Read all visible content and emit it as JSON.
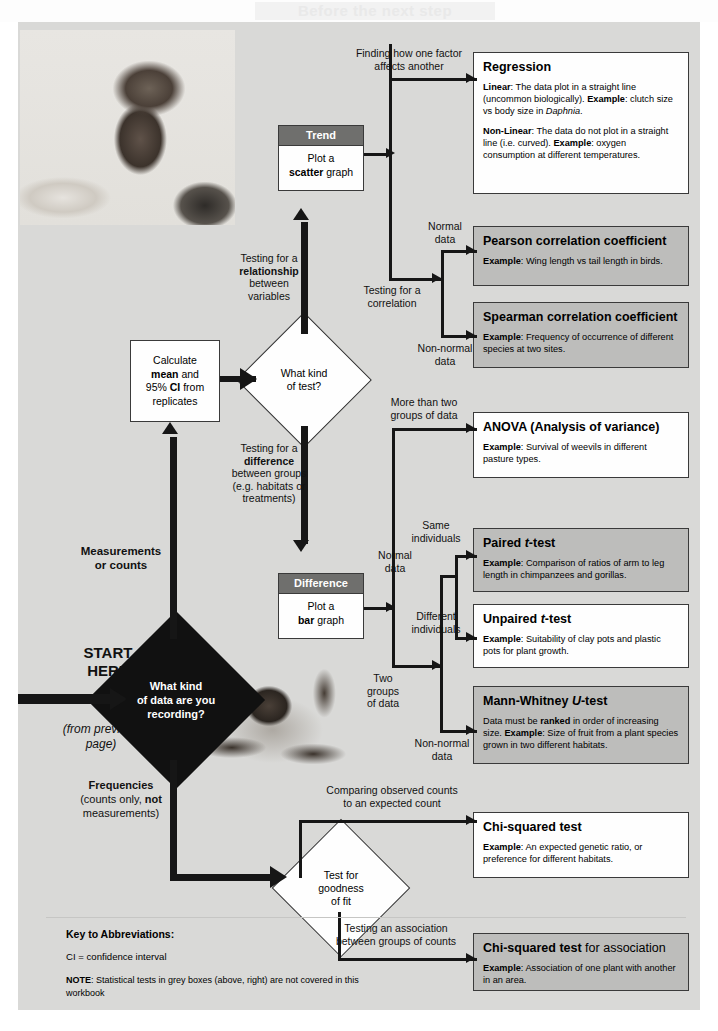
{
  "page": {
    "header_title": "Before the next step",
    "background": "#d9d9d7"
  },
  "photos": [
    {
      "name": "student-with-laptop-photo",
      "alt": "Student working at a laptop with books"
    },
    {
      "name": "crab-photo",
      "alt": "Crab"
    }
  ],
  "start": {
    "start_label": "START\nHERE",
    "start_line1": "START",
    "start_line2": "HERE",
    "from_previous": "(from previous page)",
    "from_previous_l1": "(from previous",
    "from_previous_l2": "page)"
  },
  "decisions": [
    {
      "id": "data-type",
      "style": "black",
      "line1": "What kind",
      "line2": "of data are you",
      "line3": "recording?"
    },
    {
      "id": "test-type",
      "style": "white",
      "line1": "What kind",
      "line2": "of test?"
    },
    {
      "id": "goodness-of-fit",
      "style": "white",
      "line1": "Test for",
      "line2": "goodness",
      "line3": "of fit"
    }
  ],
  "branch_labels": {
    "measurements_l1": "Measurements",
    "measurements_l2": "or counts",
    "frequencies_title": "Frequencies",
    "frequencies_l2a": "(counts only, ",
    "frequencies_l2b": "not",
    "frequencies_l3": "measurements)",
    "relationship_l1": "Testing for a",
    "relationship_l2": "relationship",
    "relationship_l3": "between",
    "relationship_l4": "variables",
    "difference_l1": "Testing for a",
    "difference_l2": "difference",
    "difference_l3": "between groups",
    "difference_l4": "(e.g. habitats or",
    "difference_l5": "treatments)",
    "one_factor_l1": "Finding how one factor",
    "one_factor_l2": "affects another",
    "correlation_l1": "Testing for a",
    "correlation_l2": "correlation",
    "normal_l1": "Normal",
    "normal_l2": "data",
    "nonnormal_l1": "Non-normal",
    "nonnormal_l2": "data",
    "more_than_two_l1": "More than two",
    "more_than_two_l2": "groups of data",
    "two_groups_l1": "Two",
    "two_groups_l2": "groups",
    "two_groups_l3": "of data",
    "same_individuals_l1": "Same",
    "same_individuals_l2": "individuals",
    "different_individuals_l1": "Different",
    "different_individuals_l2": "individuals",
    "normal_data2_l1": "Normal",
    "normal_data2_l2": "data",
    "nonnormal_data2_l1": "Non-normal",
    "nonnormal_data2_l2": "data",
    "observed_counts_l1": "Comparing observed counts",
    "observed_counts_l2": "to an expected count",
    "association_l1": "Testing an association",
    "association_l2": "between groups of counts"
  },
  "process_box": {
    "name": "calculate-mean-ci",
    "l1": "Calculate",
    "l2a": "mean",
    "l2b": " and",
    "l3a": "95% ",
    "l3b": "CI",
    "l3c": " from",
    "l4": "replicates"
  },
  "graph_boxes": [
    {
      "id": "trend",
      "header": "Trend",
      "body_l1": "Plot a",
      "body_bold": "scatter",
      "body_rest": " graph"
    },
    {
      "id": "difference",
      "header": "Difference",
      "body_l1": "Plot a",
      "body_bold": "bar",
      "body_rest": " graph"
    }
  ],
  "result_boxes": [
    {
      "id": "regression",
      "style": "white",
      "title": "Regression",
      "paras": [
        {
          "lead": "Linear",
          "lead_sep": ":  ",
          "text": "The data plot in a straight line (uncommon biologically).  ",
          "lead2": "Example",
          "text2": ": clutch size vs body size in ",
          "italic": "Daphnia",
          "text3": "."
        },
        {
          "lead": "Non-Linear",
          "lead_sep": ":  ",
          "text": "The data do not plot in a straight line (i.e. curved). ",
          "lead2": "Example",
          "text2": ": oxygen consumption at different temperatures."
        }
      ]
    },
    {
      "id": "pearson",
      "style": "grey",
      "title": "Pearson correlation coefficient",
      "paras": [
        {
          "lead": "Example",
          "lead_sep": ": ",
          "text": "Wing length vs tail length in birds."
        }
      ]
    },
    {
      "id": "spearman",
      "style": "grey",
      "title": "Spearman correlation coefficient",
      "paras": [
        {
          "lead": "Example",
          "lead_sep": ": ",
          "text": "Frequency of occurrence of different species at two sites."
        }
      ]
    },
    {
      "id": "anova",
      "style": "white",
      "title": "ANOVA (Analysis of variance)",
      "paras": [
        {
          "lead": "Example",
          "lead_sep": ": ",
          "text": "Survival of weevils in different pasture types."
        }
      ]
    },
    {
      "id": "paired-t-test",
      "style": "grey",
      "title": "Paired t-test",
      "title_plain": "Paired ",
      "title_italic": "t",
      "title_tail": "-test",
      "paras": [
        {
          "lead": "Example",
          "lead_sep": ": ",
          "text": "Comparison of ratios of arm to leg length in chimpanzees and gorillas."
        }
      ]
    },
    {
      "id": "unpaired-t-test",
      "style": "white",
      "title": "Unpaired t-test",
      "title_plain": "Unpaired ",
      "title_italic": "t",
      "title_tail": "-test",
      "paras": [
        {
          "lead": "Example",
          "lead_sep": ": ",
          "text": "Suitability of clay pots and plastic pots for plant growth."
        }
      ]
    },
    {
      "id": "mann-whitney",
      "style": "grey",
      "title": "Mann-Whitney U-test",
      "title_plain": "Mann-Whitney ",
      "title_italic": "U",
      "title_tail": "-test",
      "paras": [
        {
          "pre": "Data must be ",
          "lead": "ranked",
          "lead_sep": " ",
          "text": "in order of increasing size.  ",
          "lead2": "Example",
          "text2": ": Size of fruit from a plant species grown in two different habitats."
        }
      ]
    },
    {
      "id": "chi-squared",
      "style": "white",
      "title": "Chi-squared test",
      "paras": [
        {
          "lead": "Example",
          "lead_sep": ": ",
          "text": "An expected genetic ratio, or preference for different habitats."
        }
      ]
    },
    {
      "id": "chi-squared-association",
      "style": "grey",
      "title": "Chi-squared test for association",
      "title_bold": "Chi-squared test",
      "title_rest": " for association",
      "paras": [
        {
          "lead": "Example",
          "lead_sep": ": ",
          "text": "Association of one plant with another in an area."
        }
      ]
    }
  ],
  "key": {
    "title": "Key to Abbreviations:",
    "line_ci": "CI  = confidence interval",
    "note_lead": "NOTE",
    "note_text": ": Statistical tests in grey boxes (above, right) are not covered in this workbook"
  }
}
